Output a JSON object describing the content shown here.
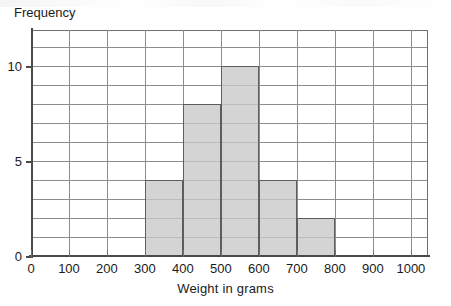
{
  "chart_data": {
    "type": "bar",
    "title": "",
    "subtitle": "",
    "xlabel": "Weight in grams",
    "ylabel": "Frequency",
    "grid": true,
    "legend": null,
    "xlim": [
      0,
      1045
    ],
    "ylim": [
      0,
      11.9
    ],
    "x_tick_labels": [
      "0",
      "100",
      "200",
      "300",
      "400",
      "500",
      "600",
      "700",
      "800",
      "900",
      "1000"
    ],
    "x_tick_values": [
      0,
      100,
      200,
      300,
      400,
      500,
      600,
      700,
      800,
      900,
      1000
    ],
    "x_minor_step": 100,
    "y_tick_labels": [
      "0",
      "5",
      "10"
    ],
    "y_tick_values": [
      0,
      5,
      10
    ],
    "y_minor_step": 1,
    "bin_width": 100,
    "categories": [
      "300-400",
      "400-500",
      "500-600",
      "600-700",
      "700-800"
    ],
    "values": [
      4,
      8,
      10,
      4,
      2
    ],
    "bins": [
      {
        "label": "300-400",
        "start": 300,
        "end": 400,
        "value": 4
      },
      {
        "label": "400-500",
        "start": 400,
        "end": 500,
        "value": 8
      },
      {
        "label": "500-600",
        "start": 500,
        "end": 600,
        "value": 10
      },
      {
        "label": "600-700",
        "start": 600,
        "end": 700,
        "value": 4
      },
      {
        "label": "700-800",
        "start": 700,
        "end": 800,
        "value": 2
      }
    ],
    "colors": {
      "bar_fill": "#c8c8c8",
      "bar_border": "#5d5d5d",
      "gridline": "#8d8d8d",
      "axis": "#4a4a4a",
      "text": "#1b1b1b",
      "background": "#ffffff"
    }
  }
}
